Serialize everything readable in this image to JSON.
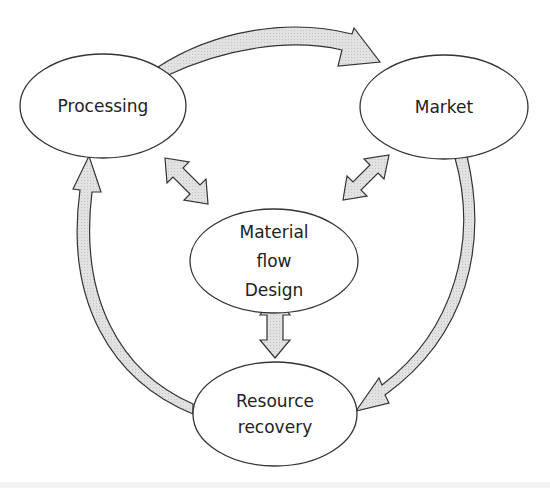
{
  "diagram": {
    "type": "cycle",
    "nodes": [
      {
        "id": "processing",
        "label": "Processing"
      },
      {
        "id": "market",
        "label": "Market"
      },
      {
        "id": "material_flow_design",
        "label_lines": [
          "Material",
          "flow",
          "Design"
        ]
      },
      {
        "id": "resource_recovery",
        "label_lines": [
          "Resource",
          "recovery"
        ]
      }
    ],
    "cycle_arrows": [
      {
        "from": "processing",
        "to": "market"
      },
      {
        "from": "market",
        "to": "resource_recovery"
      },
      {
        "from": "resource_recovery",
        "to": "processing"
      }
    ],
    "bidirectional_arrows": [
      {
        "between": [
          "material_flow_design",
          "processing"
        ]
      },
      {
        "between": [
          "material_flow_design",
          "market"
        ]
      },
      {
        "between": [
          "material_flow_design",
          "resource_recovery"
        ]
      }
    ],
    "colors": {
      "stroke": "#333333",
      "arrow_fill": "#dcdcdc",
      "node_fill": "#ffffff",
      "text": "#222222"
    }
  }
}
